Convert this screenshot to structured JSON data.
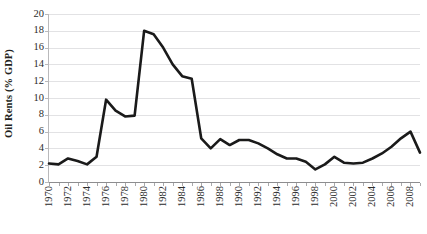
{
  "chart_data": {
    "type": "line",
    "title": "",
    "xlabel": "",
    "ylabel": "Oil Rents (% GDP)",
    "xlim": [
      1970,
      2009
    ],
    "ylim": [
      0,
      20
    ],
    "ytick_step": 2,
    "xtick_step": 1,
    "xtick_label_step": 2,
    "grid": "horizontal",
    "legend": "none",
    "line_color": "#1a1a1a",
    "gridline_color": "#e2e2e4",
    "axis_color": "#8d8d8f",
    "background_color": "#ffffff",
    "x": [
      1970,
      1971,
      1972,
      1973,
      1974,
      1975,
      1976,
      1977,
      1978,
      1979,
      1980,
      1981,
      1982,
      1983,
      1984,
      1985,
      1986,
      1987,
      1988,
      1989,
      1990,
      1991,
      1992,
      1993,
      1994,
      1995,
      1996,
      1997,
      1998,
      1999,
      2000,
      2001,
      2002,
      2003,
      2004,
      2005,
      2006,
      2007,
      2008,
      2009
    ],
    "values": [
      2.2,
      2.1,
      2.8,
      2.5,
      2.1,
      3.0,
      9.8,
      8.5,
      7.8,
      7.9,
      18.0,
      17.6,
      16.0,
      14.0,
      12.6,
      12.3,
      5.2,
      4.0,
      5.1,
      4.4,
      5.0,
      5.0,
      4.6,
      4.0,
      3.3,
      2.8,
      2.8,
      2.4,
      1.5,
      2.1,
      3.0,
      2.3,
      2.2,
      2.3,
      2.8,
      3.4,
      4.2,
      5.2,
      6.0,
      3.5
    ],
    "ytick_labels": [
      "0",
      "2",
      "4",
      "6",
      "8",
      "10",
      "12",
      "14",
      "16",
      "18",
      "20"
    ],
    "xtick_labels": [
      "1970",
      "1972",
      "1974",
      "1976",
      "1978",
      "1980",
      "1982",
      "1984",
      "1986",
      "1988",
      "1990",
      "1992",
      "1994",
      "1996",
      "1998",
      "2000",
      "2002",
      "2004",
      "2006",
      "2008"
    ]
  }
}
